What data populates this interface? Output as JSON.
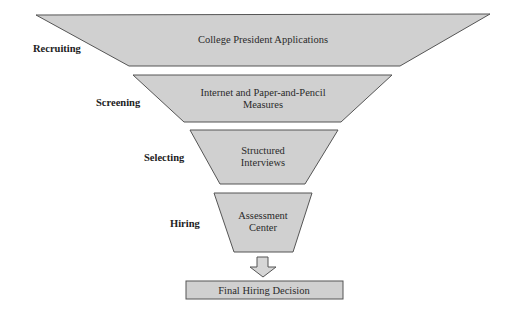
{
  "diagram": {
    "type": "selection-funnel",
    "colors": {
      "fill": "#d0d0d0",
      "stroke": "#555555",
      "text": "#2a2a2a",
      "background": "#ffffff"
    },
    "stages": [
      {
        "phase": "Recruiting",
        "lines": [
          "College President Applications"
        ]
      },
      {
        "phase": "Screening",
        "lines": [
          "Internet and Paper-and-Pencil",
          "Measures"
        ]
      },
      {
        "phase": "Selecting",
        "lines": [
          "Structured",
          "Interviews"
        ]
      },
      {
        "phase": "Hiring",
        "lines": [
          "Assessment",
          "Center"
        ]
      }
    ],
    "arrow": {
      "icon": "down-arrow-icon"
    },
    "outcome": {
      "label": "Final Hiring Decision"
    }
  }
}
